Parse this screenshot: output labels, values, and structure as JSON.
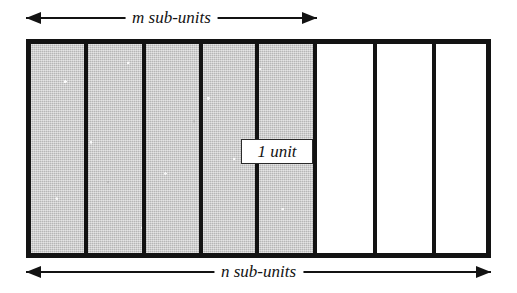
{
  "figure": {
    "type": "unit-subdivision-diagram",
    "top_dimension": {
      "label": "m sub-units",
      "arrow": "double-headed",
      "spans_columns": 5
    },
    "bottom_dimension": {
      "label": "n sub-units",
      "arrow": "double-headed",
      "spans_columns": 8
    },
    "callout": {
      "label": "1 unit"
    },
    "columns": [
      {
        "index": 1,
        "fill": "shaded"
      },
      {
        "index": 2,
        "fill": "shaded"
      },
      {
        "index": 3,
        "fill": "shaded"
      },
      {
        "index": 4,
        "fill": "shaded"
      },
      {
        "index": 5,
        "fill": "shaded"
      },
      {
        "index": 6,
        "fill": "empty"
      },
      {
        "index": 7,
        "fill": "empty"
      },
      {
        "index": 8,
        "fill": "empty"
      }
    ],
    "colors": {
      "outline": "#131313",
      "shaded_fill": "#cccccc",
      "empty_fill": "#ffffff",
      "background": "#ffffff"
    }
  }
}
